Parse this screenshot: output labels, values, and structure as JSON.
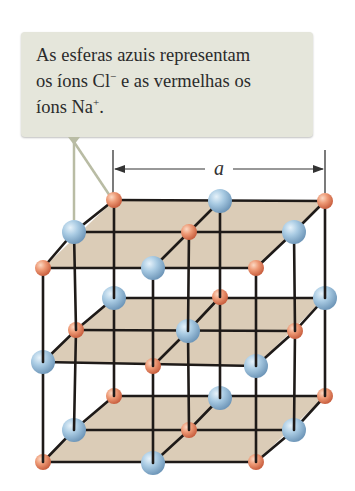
{
  "callout": {
    "line1": "As esferas azuis representam",
    "line2_a": "os íons Cl",
    "line2_sup": "−",
    "line2_b": " e as vermelhas os",
    "line3_a": "íons Na",
    "line3_sup": "+",
    "line3_b": "."
  },
  "dimension": {
    "label": "a",
    "x1": 113,
    "x2": 325,
    "y": 169
  },
  "colors": {
    "callout_bg": "#e5e6db",
    "plane_fill": "#d9c9b3",
    "edge": "#1e1a18",
    "pointer": "#b9bca4",
    "cl_light": "#d4e7f4",
    "cl_dark": "#7ba3c4",
    "na_light": "#f8c6a8",
    "na_dark": "#d46a48"
  },
  "legend": {
    "blue_spheres": "Cl− ions",
    "red_spheres": "Na+ ions"
  },
  "lattice": {
    "layers": [
      {
        "name": "top",
        "back": [
          {
            "x": 114,
            "y": 200,
            "ion": "Na"
          },
          {
            "x": 220,
            "y": 201,
            "ion": "Cl"
          },
          {
            "x": 325,
            "y": 201,
            "ion": "Na"
          }
        ],
        "middle": [
          {
            "x": 74,
            "y": 232,
            "ion": "Cl"
          },
          {
            "x": 189,
            "y": 232,
            "ion": "Na"
          },
          {
            "x": 294,
            "y": 232,
            "ion": "Cl"
          }
        ],
        "front": [
          {
            "x": 43,
            "y": 268,
            "ion": "Na"
          },
          {
            "x": 153,
            "y": 268,
            "ion": "Cl"
          },
          {
            "x": 256,
            "y": 268,
            "ion": "Na"
          }
        ]
      },
      {
        "name": "middle",
        "back": [
          {
            "x": 114,
            "y": 298,
            "ion": "Cl"
          },
          {
            "x": 220,
            "y": 297,
            "ion": "Na"
          },
          {
            "x": 325,
            "y": 298,
            "ion": "Cl"
          }
        ],
        "middle": [
          {
            "x": 76,
            "y": 330,
            "ion": "Na"
          },
          {
            "x": 188,
            "y": 331,
            "ion": "Cl"
          },
          {
            "x": 295,
            "y": 331,
            "ion": "Na"
          }
        ],
        "front": [
          {
            "x": 43,
            "y": 362,
            "ion": "Cl"
          },
          {
            "x": 153,
            "y": 366,
            "ion": "Na"
          },
          {
            "x": 256,
            "y": 366,
            "ion": "Cl"
          }
        ]
      },
      {
        "name": "bottom",
        "back": [
          {
            "x": 114,
            "y": 396,
            "ion": "Na"
          },
          {
            "x": 220,
            "y": 398,
            "ion": "Cl"
          },
          {
            "x": 325,
            "y": 396,
            "ion": "Na"
          }
        ],
        "middle": [
          {
            "x": 74,
            "y": 430,
            "ion": "Cl"
          },
          {
            "x": 189,
            "y": 430,
            "ion": "Na"
          },
          {
            "x": 294,
            "y": 430,
            "ion": "Cl"
          }
        ],
        "front": [
          {
            "x": 43,
            "y": 462,
            "ion": "Na"
          },
          {
            "x": 153,
            "y": 463,
            "ion": "Cl"
          },
          {
            "x": 256,
            "y": 462,
            "ion": "Na"
          }
        ]
      }
    ],
    "radius": {
      "Cl": 12,
      "Na": 8
    }
  }
}
